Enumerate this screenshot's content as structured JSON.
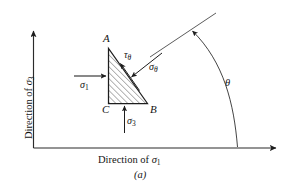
{
  "figure": {
    "caption": "(a)",
    "axes": {
      "y_label_prefix": "Direction of ",
      "y_label_symbol": "σ",
      "y_label_subscript": "3",
      "x_label_prefix": "Direction of ",
      "x_label_symbol": "σ",
      "x_label_subscript": "1"
    },
    "vertices": {
      "a": "A",
      "b": "B",
      "c": "C"
    },
    "stresses": {
      "sigma1_symbol": "σ",
      "sigma1_sub": "1",
      "sigma3_symbol": "σ",
      "sigma3_sub": "3",
      "sigma_theta_symbol": "σ",
      "sigma_theta_sub": "θ",
      "tau_theta_symbol": "τ",
      "tau_theta_sub": "θ"
    },
    "angle": {
      "theta_symbol": "θ"
    },
    "colors": {
      "ink": "#141414",
      "line": "#2b2b2b",
      "hatch": "#3a3a3a",
      "background": "#ffffff"
    }
  }
}
